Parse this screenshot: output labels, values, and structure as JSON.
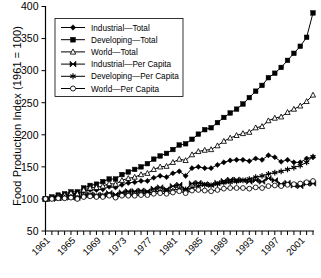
{
  "chart_data": {
    "type": "line",
    "title": "",
    "xlabel": "",
    "ylabel": "Food Production Index (1961 = 100)",
    "ylim": [
      50,
      400
    ],
    "yticks": [
      50,
      100,
      150,
      200,
      250,
      300,
      350,
      400
    ],
    "xlim": [
      1961,
      2003
    ],
    "xticks": [
      1961,
      1965,
      1969,
      1973,
      1977,
      1981,
      1985,
      1989,
      1993,
      1997,
      2001
    ],
    "xtick_labels": [
      "1961",
      "1965",
      "1969",
      "1973",
      "1977",
      "1981",
      "1985",
      "1989",
      "1993",
      "1997",
      "2001"
    ],
    "grid": false,
    "legend_position": "upper-left-inside",
    "x": [
      1961,
      1962,
      1963,
      1964,
      1965,
      1966,
      1967,
      1968,
      1969,
      1970,
      1971,
      1972,
      1973,
      1974,
      1975,
      1976,
      1977,
      1978,
      1979,
      1980,
      1981,
      1982,
      1983,
      1984,
      1985,
      1986,
      1987,
      1988,
      1989,
      1990,
      1991,
      1992,
      1993,
      1994,
      1995,
      1996,
      1997,
      1998,
      1999,
      2000,
      2001,
      2002,
      2003
    ],
    "series": [
      {
        "name": "Industrial—Total",
        "marker": "filled-diamond",
        "values": [
          100,
          101,
          103,
          105,
          107,
          107,
          112,
          114,
          114,
          115,
          119,
          118,
          122,
          125,
          126,
          128,
          128,
          133,
          136,
          134,
          140,
          143,
          136,
          148,
          150,
          148,
          148,
          153,
          157,
          160,
          161,
          161,
          159,
          163,
          161,
          168,
          165,
          158,
          161,
          157,
          157,
          163,
          165
        ]
      },
      {
        "name": "Developing—Total",
        "marker": "filled-square",
        "values": [
          100,
          103,
          106,
          108,
          111,
          111,
          117,
          121,
          123,
          127,
          131,
          131,
          138,
          142,
          146,
          150,
          155,
          162,
          167,
          171,
          177,
          184,
          186,
          193,
          201,
          208,
          211,
          219,
          227,
          234,
          240,
          248,
          258,
          268,
          277,
          289,
          296,
          305,
          316,
          327,
          338,
          352,
          390
        ]
      },
      {
        "name": "World—Total",
        "marker": "open-triangle",
        "values": [
          100,
          102,
          104,
          106,
          109,
          108,
          114,
          117,
          118,
          120,
          124,
          123,
          129,
          132,
          134,
          138,
          140,
          146,
          150,
          151,
          157,
          162,
          160,
          169,
          174,
          176,
          177,
          183,
          190,
          195,
          199,
          202,
          204,
          211,
          213,
          222,
          226,
          228,
          235,
          240,
          245,
          252,
          262
        ]
      },
      {
        "name": "Industrial—Per Capita",
        "marker": "bowtie",
        "values": [
          100,
          100,
          101,
          102,
          103,
          102,
          106,
          107,
          106,
          106,
          109,
          107,
          110,
          112,
          112,
          113,
          112,
          116,
          118,
          115,
          120,
          122,
          115,
          124,
          125,
          123,
          122,
          125,
          128,
          130,
          130,
          129,
          127,
          129,
          127,
          132,
          129,
          123,
          125,
          121,
          120,
          124,
          124
        ]
      },
      {
        "name": "Developing—Per Capita",
        "marker": "asterisk",
        "values": [
          100,
          101,
          102,
          102,
          103,
          101,
          104,
          105,
          104,
          105,
          106,
          103,
          106,
          107,
          107,
          108,
          109,
          111,
          112,
          112,
          113,
          116,
          115,
          117,
          120,
          122,
          121,
          123,
          125,
          126,
          127,
          129,
          131,
          134,
          136,
          139,
          141,
          143,
          146,
          149,
          152,
          157,
          166
        ]
      },
      {
        "name": "World—Per Capita",
        "marker": "open-circle",
        "values": [
          100,
          100,
          101,
          101,
          102,
          100,
          103,
          104,
          103,
          103,
          105,
          102,
          105,
          105,
          105,
          106,
          106,
          108,
          109,
          108,
          110,
          112,
          109,
          113,
          114,
          113,
          112,
          114,
          116,
          117,
          117,
          117,
          116,
          118,
          117,
          120,
          121,
          120,
          122,
          123,
          124,
          126,
          128
        ]
      }
    ]
  }
}
